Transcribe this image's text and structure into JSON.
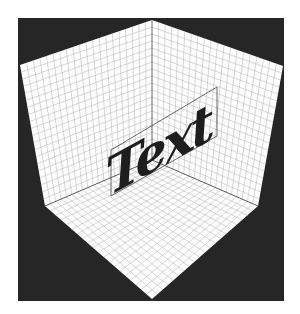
{
  "figure": {
    "label_text": "Text",
    "colors": {
      "background_square": "#262626",
      "surface": "#ffffff",
      "grid_line": "#b8b8b8",
      "edge_line": "#555555",
      "text": "#1e1e1e",
      "frame": "#444444"
    },
    "grid_divisions": 20
  }
}
